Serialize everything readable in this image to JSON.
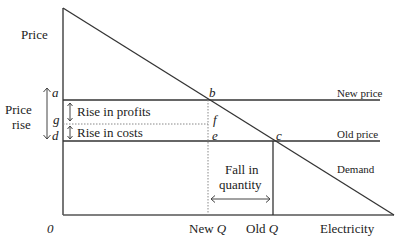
{
  "diagram": {
    "axis": {
      "y_label": "Price",
      "x_label": "Electricity",
      "origin": "0"
    },
    "points": {
      "a": "a",
      "b": "b",
      "c": "c",
      "d": "d",
      "e": "e",
      "f": "f",
      "g": "g"
    },
    "line_labels": {
      "new_price": "New price",
      "old_price": "Old price",
      "demand": "Demand"
    },
    "annotations": {
      "price_rise_1": "Price",
      "price_rise_2": "rise",
      "rise_in_profits": "Rise in profits",
      "rise_in_costs": "Rise in costs",
      "fall_in_quantity_1": "Fall in",
      "fall_in_quantity_2": "quantity"
    },
    "x_ticks": {
      "new_q_word": "New",
      "old_q_word": "Old",
      "q": "Q"
    },
    "colors": {
      "line": "#333333",
      "dotted": "#777777"
    }
  }
}
